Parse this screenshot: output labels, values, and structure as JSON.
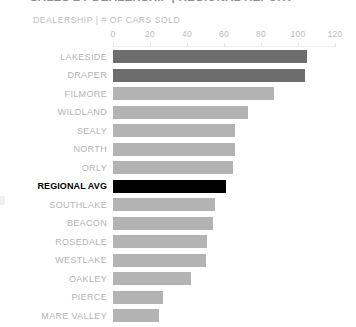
{
  "title": "SALES BY DEALERSHIP | REGIONAL REPORT",
  "subtitle": "DEALERSHIP | # OF CARS SOLD",
  "colors": {
    "bar_default": "#b3b3b3",
    "bar_dark": "#6d6d6d",
    "bar_highlight": "#000000",
    "label": "#b4b4b4",
    "label_highlight": "#000000",
    "axis": "#ededed",
    "background": "#ffffff"
  },
  "chart_data": {
    "type": "bar",
    "orientation": "horizontal",
    "title": "SALES BY DEALERSHIP | REGIONAL REPORT",
    "subtitle": "DEALERSHIP | # OF CARS SOLD",
    "xlabel": "# OF CARS SOLD",
    "ylabel": "DEALERSHIP",
    "xlim": [
      0,
      120
    ],
    "xticks": [
      0,
      20,
      40,
      60,
      80,
      100,
      120
    ],
    "xtick_labels": [
      "0",
      "20",
      "40",
      "60",
      "80",
      "100",
      "120"
    ],
    "grid": false,
    "legend": "none",
    "highlight_category": "REGIONAL AVG",
    "categories": [
      "LAKESIDE",
      "DRAPER",
      "FILMORE",
      "WILDLAND",
      "SEALY",
      "NORTH",
      "ORLY",
      "REGIONAL AVG",
      "SOUTHLAKE",
      "BEACON",
      "ROSEDALE",
      "WESTLAKE",
      "OAKLEY",
      "PIERCE",
      "MARE VALLEY"
    ],
    "values": [
      105,
      104,
      87,
      73,
      66,
      66,
      65,
      61,
      55,
      54,
      51,
      50,
      42,
      27,
      25
    ],
    "bars": [
      {
        "label": "LAKESIDE",
        "value": 105,
        "style": "dark"
      },
      {
        "label": "DRAPER",
        "value": 104,
        "style": "dark"
      },
      {
        "label": "FILMORE",
        "value": 87,
        "style": "default"
      },
      {
        "label": "WILDLAND",
        "value": 73,
        "style": "default"
      },
      {
        "label": "SEALY",
        "value": 66,
        "style": "default"
      },
      {
        "label": "NORTH",
        "value": 66,
        "style": "default"
      },
      {
        "label": "ORLY",
        "value": 65,
        "style": "default"
      },
      {
        "label": "REGIONAL AVG",
        "value": 61,
        "style": "black"
      },
      {
        "label": "SOUTHLAKE",
        "value": 55,
        "style": "default"
      },
      {
        "label": "BEACON",
        "value": 54,
        "style": "default"
      },
      {
        "label": "ROSEDALE",
        "value": 51,
        "style": "default"
      },
      {
        "label": "WESTLAKE",
        "value": 50,
        "style": "default"
      },
      {
        "label": "OAKLEY",
        "value": 42,
        "style": "default"
      },
      {
        "label": "PIERCE",
        "value": 27,
        "style": "default"
      },
      {
        "label": "MARE VALLEY",
        "value": 25,
        "style": "default"
      }
    ]
  }
}
